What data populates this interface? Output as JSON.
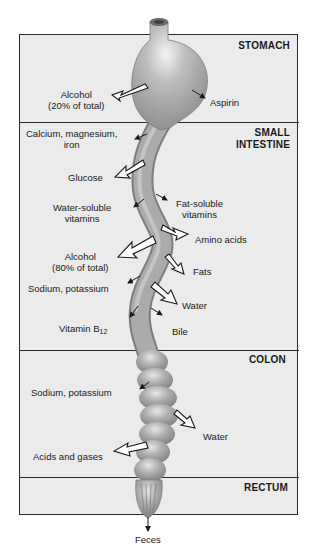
{
  "sections": [
    {
      "id": "stomach",
      "title_lines": [
        "STOMACH"
      ]
    },
    {
      "id": "small-intestine",
      "title_lines": [
        "SMALL",
        "INTESTINE"
      ]
    },
    {
      "id": "colon",
      "title_lines": [
        "COLON"
      ]
    },
    {
      "id": "rectum",
      "title_lines": [
        "RECTUM"
      ]
    }
  ],
  "labels": {
    "stomach": {
      "alcohol": [
        "Alcohol",
        "(20% of total)"
      ],
      "aspirin": "Aspirin"
    },
    "small_intestine": {
      "minerals": [
        "Calcium, magnesium,",
        "iron"
      ],
      "glucose": "Glucose",
      "water_soluble": [
        "Water-soluble",
        "vitamins"
      ],
      "fat_soluble": [
        "Fat-soluble",
        "vitamins"
      ],
      "amino_acids": "Amino acids",
      "alcohol": [
        "Alcohol",
        "(80% of total)"
      ],
      "fats": "Fats",
      "sodium_potassium": "Sodium, potassium",
      "water": "Water",
      "vitamin_b12": "Vitamin B",
      "vitamin_b12_sub": "12",
      "bile": "Bile"
    },
    "colon": {
      "sodium_potassium": "Sodium, potassium",
      "water": "Water",
      "acids_gases": "Acids and gases"
    },
    "output": {
      "feces": "Feces"
    }
  },
  "legend": {
    "large_arrow": "major absorption/secretion",
    "small_arrow": "minor absorption/secretion"
  },
  "colors": {
    "background": "#ffffff",
    "panel": "#ebebeb",
    "border": "#2a2a2a",
    "tube": "#a6a6a6",
    "tube_shadow": "#8a8a8a",
    "tube_highlight": "#dcdcdc",
    "text": "#1a1a1a"
  }
}
